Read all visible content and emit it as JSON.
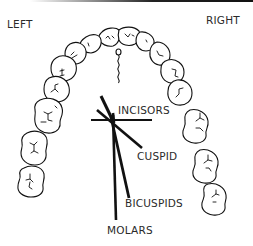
{
  "diagram": {
    "type": "dental-arch-illustration",
    "side_labels": {
      "left": "LEFT",
      "right": "RIGHT"
    },
    "tooth_labels": {
      "incisors": "INCISORS",
      "cuspid": "CUSPID",
      "bicuspids": "BICUSPIDS",
      "molars": "MOLARS"
    },
    "colors": {
      "stroke": "#111111",
      "text": "#2a2a2a",
      "background": "#ffffff"
    }
  }
}
